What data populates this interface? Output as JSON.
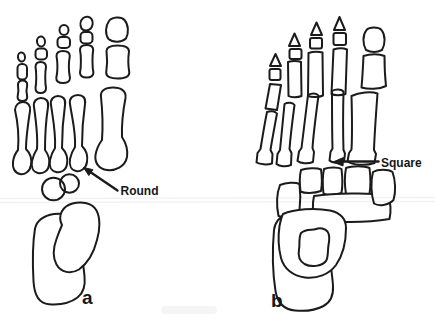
{
  "figure": {
    "background_color": "#ffffff",
    "line_color": "#1b1b1b",
    "text_color": "#161616"
  },
  "panel_a": {
    "label": "a",
    "annotation": "Round"
  },
  "panel_b": {
    "label": "b",
    "annotation": "Square"
  }
}
